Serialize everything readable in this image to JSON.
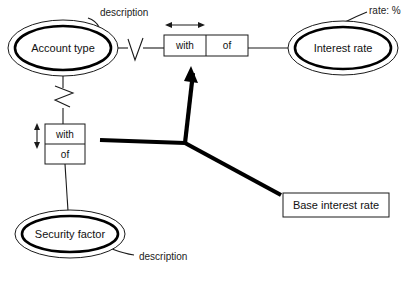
{
  "diagram": {
    "kind": "er-diagram",
    "background_color": "#ffffff",
    "line_color": "#1a1a1a",
    "entities": [
      {
        "id": "account-type",
        "label": "Account type",
        "shape": "double-ellipse",
        "cx": 63,
        "cy": 48,
        "rx": 55,
        "ry": 28
      },
      {
        "id": "interest-rate",
        "label": "Interest rate",
        "shape": "double-ellipse",
        "cx": 343,
        "cy": 48,
        "rx": 55,
        "ry": 27
      },
      {
        "id": "security-factor",
        "label": "Security factor",
        "shape": "double-ellipse",
        "cx": 70,
        "cy": 234,
        "rx": 55,
        "ry": 24
      }
    ],
    "relationship_boxes": [
      {
        "id": "rel-horizontal",
        "orientation": "horizontal",
        "cells": [
          "with",
          "of"
        ],
        "x": 164,
        "y": 35,
        "width": 84,
        "height": 21
      },
      {
        "id": "rel-vertical",
        "orientation": "vertical",
        "cells": [
          "with",
          "of"
        ],
        "x": 45,
        "y": 124,
        "width": 40,
        "height": 40
      }
    ],
    "plain_boxes": [
      {
        "id": "base-interest-rate",
        "label": "Base interest rate",
        "x": 283,
        "y": 193,
        "width": 106,
        "height": 24
      }
    ],
    "annotations": [
      {
        "id": "ann-description-top",
        "text": "description",
        "x": 100,
        "y": 16
      },
      {
        "id": "ann-rate-percent",
        "text": "rate: %",
        "x": 369,
        "y": 14
      },
      {
        "id": "ann-description-bottom",
        "text": "description",
        "x": 139,
        "y": 256
      }
    ],
    "dimension_arrows": [
      {
        "id": "dim-horizontal",
        "orientation": "horizontal",
        "x1": 166,
        "x2": 204,
        "y": 25
      },
      {
        "id": "dim-vertical",
        "orientation": "vertical",
        "y1": 124,
        "y2": 148,
        "x": 37
      }
    ],
    "cardinality_markers": [
      {
        "id": "crowfoot-account-type-right",
        "type": "chevron-v",
        "x": 128,
        "y": 48
      },
      {
        "id": "crowfoot-account-type-bottom",
        "type": "chevron-z",
        "x": 63,
        "y": 98
      }
    ],
    "pointer": {
      "id": "thick-pointer",
      "junction_x": 185,
      "junction_y": 143,
      "arrow_tip_x": 191,
      "arrow_tip_y": 66,
      "left_end_x": 100,
      "left_end_y": 140,
      "right_end_x": 281,
      "right_end_y": 195
    }
  }
}
